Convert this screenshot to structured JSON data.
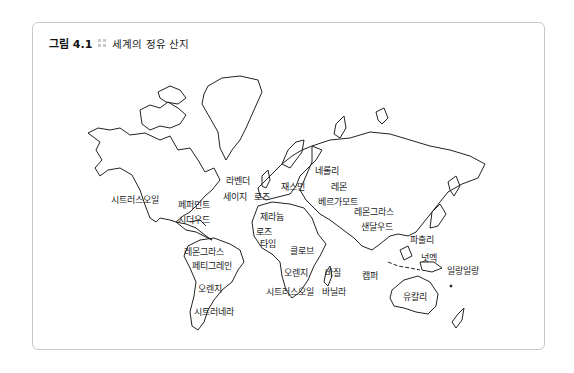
{
  "figure": {
    "number": "그림 4.1",
    "title": "세계의 정유 산지"
  },
  "labels": [
    {
      "text": "시트러스오일",
      "x": 111,
      "y": 201
    },
    {
      "text": "페퍼민트",
      "x": 178,
      "y": 206
    },
    {
      "text": "시더우드",
      "x": 178,
      "y": 221
    },
    {
      "text": "라벤더",
      "x": 226,
      "y": 182
    },
    {
      "text": "세이지",
      "x": 223,
      "y": 198
    },
    {
      "text": "로즈",
      "x": 254,
      "y": 198
    },
    {
      "text": "재스민",
      "x": 281,
      "y": 188
    },
    {
      "text": "네롤리",
      "x": 315,
      "y": 172
    },
    {
      "text": "레몬",
      "x": 331,
      "y": 188
    },
    {
      "text": "베르가모트",
      "x": 318,
      "y": 203
    },
    {
      "text": "제라늄",
      "x": 260,
      "y": 218
    },
    {
      "text": "로즈",
      "x": 256,
      "y": 233
    },
    {
      "text": "타임",
      "x": 260,
      "y": 245
    },
    {
      "text": "레몬그라스",
      "x": 354,
      "y": 213
    },
    {
      "text": "샌달우드",
      "x": 361,
      "y": 228
    },
    {
      "text": "레몬그라스",
      "x": 184,
      "y": 253
    },
    {
      "text": "페티그레인",
      "x": 192,
      "y": 267
    },
    {
      "text": "클로브",
      "x": 290,
      "y": 252
    },
    {
      "text": "파출리",
      "x": 410,
      "y": 241
    },
    {
      "text": "넛멕",
      "x": 421,
      "y": 259
    },
    {
      "text": "일랑일랑",
      "x": 447,
      "y": 272
    },
    {
      "text": "오렌지",
      "x": 284,
      "y": 274
    },
    {
      "text": "바질",
      "x": 325,
      "y": 274
    },
    {
      "text": "캠퍼",
      "x": 362,
      "y": 277
    },
    {
      "text": "오렌지",
      "x": 198,
      "y": 290
    },
    {
      "text": "시트러스오일",
      "x": 266,
      "y": 293
    },
    {
      "text": "바닐라",
      "x": 322,
      "y": 293
    },
    {
      "text": "유칼리",
      "x": 403,
      "y": 298
    },
    {
      "text": "시트러네라",
      "x": 194,
      "y": 313
    }
  ]
}
